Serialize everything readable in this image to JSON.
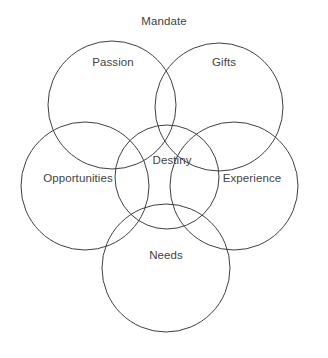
{
  "diagram": {
    "type": "venn",
    "title": "Mandate",
    "canvas": {
      "width": 328,
      "height": 358
    },
    "style": {
      "background_color": "#ffffff",
      "stroke_color": "#3f3f3f",
      "stroke_width": 1,
      "text_color": "#434343"
    },
    "title_position": {
      "x": 164,
      "y": 22
    },
    "sets": [
      {
        "id": "passion",
        "label": "Passion",
        "position": "top-left",
        "circle": {
          "cx": 112,
          "cy": 105,
          "r": 64
        },
        "label_position": {
          "x": 113,
          "y": 62
        }
      },
      {
        "id": "gifts",
        "label": "Gifts",
        "position": "top-right",
        "circle": {
          "cx": 219,
          "cy": 107,
          "r": 64
        },
        "label_position": {
          "x": 224,
          "y": 62
        }
      },
      {
        "id": "opportunities",
        "label": "Opportunities",
        "position": "left",
        "circle": {
          "cx": 85,
          "cy": 186,
          "r": 64
        },
        "label_position": {
          "x": 78,
          "y": 178
        }
      },
      {
        "id": "experience",
        "label": "Experience",
        "position": "right",
        "circle": {
          "cx": 234,
          "cy": 186,
          "r": 64
        },
        "label_position": {
          "x": 252,
          "y": 178
        }
      },
      {
        "id": "needs",
        "label": "Needs",
        "position": "bottom",
        "circle": {
          "cx": 166,
          "cy": 268,
          "r": 64
        },
        "label_position": {
          "x": 166,
          "y": 255
        }
      }
    ],
    "intersection": {
      "id": "destiny",
      "label": "Destiny",
      "position": "center",
      "circle": {
        "cx": 167,
        "cy": 177,
        "r": 52
      },
      "label_position": {
        "x": 172,
        "y": 160
      }
    }
  }
}
